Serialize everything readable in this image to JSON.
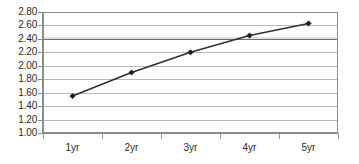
{
  "chart_data": {
    "type": "line",
    "title": "",
    "subtitle": "",
    "xlabel": "",
    "ylabel": "",
    "categories": [
      "1yr",
      "2yr",
      "3yr",
      "4yr",
      "5yr"
    ],
    "series": [
      {
        "name": "",
        "values": [
          1.55,
          1.9,
          2.2,
          2.45,
          2.63
        ]
      }
    ],
    "ylim": [
      1.0,
      2.8
    ],
    "ytick_step": 0.2,
    "ytick_labels": [
      "1.00",
      "1.20",
      "1.40",
      "1.60",
      "1.80",
      "2.00",
      "2.20",
      "2.40",
      "2.60",
      "2.80"
    ],
    "ytick_values": [
      1.0,
      1.2,
      1.4,
      1.6,
      1.8,
      2.0,
      2.2,
      2.4,
      2.6,
      2.8
    ],
    "grid": true,
    "grid_axis": "y",
    "emphasized_gridline": 2.4,
    "legend": false,
    "legend_position": "none",
    "marker": "diamond",
    "annotations": [],
    "colors": {
      "line": "#2f2f2f",
      "marker": "#1d1d1d",
      "grid": "#b9b9b9",
      "grid_emphasis": "#6f6f6f",
      "axis": "#8c8c8c",
      "text": "#2b2b2b",
      "background": "#ffffff"
    }
  }
}
